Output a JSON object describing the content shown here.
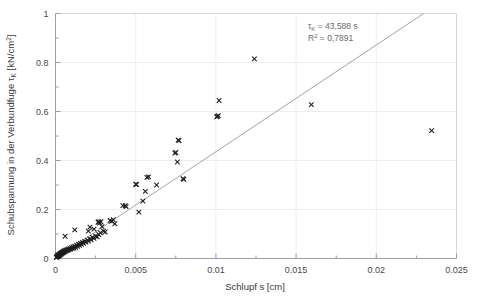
{
  "chart_data": {
    "type": "scatter",
    "title": "",
    "xlabel": "Schlupf  s  [cm]",
    "ylabel": "Schubspannung in der Verbundfuge τₖ  [kN/cm²]",
    "ylabel_parts": {
      "main": "Schubspannung in der Verbundfuge ",
      "symbol": "τ",
      "subscript": "K",
      "units": "  [kN/cm",
      "superscript": "2",
      "units_close": "]"
    },
    "xlabel_parts": {
      "name": "Schlupf",
      "symbol": "s",
      "units": "[cm]"
    },
    "xlim": [
      0,
      0.025
    ],
    "ylim": [
      0,
      1
    ],
    "xticks": [
      0,
      0.005,
      0.01,
      0.015,
      0.02,
      0.025
    ],
    "xtick_labels": [
      "0",
      "0.005",
      "0.01",
      "0.015",
      "0.02",
      "0.025"
    ],
    "yticks": [
      0,
      0.2,
      0.4,
      0.6,
      0.8,
      1
    ],
    "ytick_labels": [
      "0",
      "0.2",
      "0.4",
      "0.6",
      "0.8",
      "1"
    ],
    "xminor_count": 1,
    "yminor_count": 1,
    "grid": true,
    "grid_color": "#eceff1",
    "legend": false,
    "marker": "x",
    "marker_color": "#1d1d1d",
    "marker_size": 4.6,
    "series": [
      {
        "name": "Messwerte",
        "points": [
          [
            5e-05,
            0.004
          ],
          [
            8e-05,
            0.006
          ],
          [
            0.0001,
            0.008
          ],
          [
            0.00012,
            0.01
          ],
          [
            0.00014,
            0.012
          ],
          [
            0.00016,
            0.009
          ],
          [
            0.00018,
            0.014
          ],
          [
            0.0002,
            0.011
          ],
          [
            0.00022,
            0.016
          ],
          [
            0.00024,
            0.013
          ],
          [
            0.00026,
            0.018
          ],
          [
            0.00028,
            0.015
          ],
          [
            0.0003,
            0.02
          ],
          [
            0.00032,
            0.017
          ],
          [
            0.00034,
            0.022
          ],
          [
            0.00036,
            0.019
          ],
          [
            0.00038,
            0.024
          ],
          [
            0.0004,
            0.021
          ],
          [
            0.00042,
            0.026
          ],
          [
            0.00045,
            0.023
          ],
          [
            0.00048,
            0.028
          ],
          [
            0.0005,
            0.025
          ],
          [
            0.00052,
            0.03
          ],
          [
            0.00055,
            0.027
          ],
          [
            0.00058,
            0.032
          ],
          [
            0.0006,
            0.029
          ],
          [
            0.00064,
            0.034
          ],
          [
            0.00068,
            0.031
          ],
          [
            0.00072,
            0.036
          ],
          [
            0.00076,
            0.033
          ],
          [
            0.0008,
            0.038
          ],
          [
            0.00085,
            0.035
          ],
          [
            0.0009,
            0.041
          ],
          [
            0.00095,
            0.038
          ],
          [
            0.001,
            0.044
          ],
          [
            0.00105,
            0.04
          ],
          [
            0.0011,
            0.047
          ],
          [
            0.00115,
            0.043
          ],
          [
            0.0012,
            0.05
          ],
          [
            0.00126,
            0.046
          ],
          [
            0.00132,
            0.054
          ],
          [
            0.00138,
            0.05
          ],
          [
            0.00144,
            0.058
          ],
          [
            0.0015,
            0.054
          ],
          [
            0.00156,
            0.062
          ],
          [
            0.00162,
            0.058
          ],
          [
            0.00168,
            0.066
          ],
          [
            0.00175,
            0.062
          ],
          [
            0.00182,
            0.07
          ],
          [
            0.0019,
            0.067
          ],
          [
            0.00198,
            0.075
          ],
          [
            0.00206,
            0.071
          ],
          [
            0.00214,
            0.08
          ],
          [
            0.00222,
            0.076
          ],
          [
            0.0023,
            0.086
          ],
          [
            0.0024,
            0.082
          ],
          [
            0.0025,
            0.092
          ],
          [
            0.0026,
            0.088
          ],
          [
            0.0027,
            0.098
          ],
          [
            0.0028,
            0.105
          ],
          [
            0.0006,
            0.091
          ],
          [
            0.0012,
            0.117
          ],
          [
            0.00205,
            0.112
          ],
          [
            0.00215,
            0.128
          ],
          [
            0.0024,
            0.12
          ],
          [
            0.00265,
            0.148
          ],
          [
            0.0027,
            0.15
          ],
          [
            0.00275,
            0.145
          ],
          [
            0.00283,
            0.15
          ],
          [
            0.0029,
            0.13
          ],
          [
            0.003,
            0.112
          ],
          [
            0.0031,
            0.108
          ],
          [
            0.0034,
            0.155
          ],
          [
            0.0035,
            0.152
          ],
          [
            0.0036,
            0.158
          ],
          [
            0.0037,
            0.142
          ],
          [
            0.0042,
            0.216
          ],
          [
            0.00435,
            0.216
          ],
          [
            0.0044,
            0.212
          ],
          [
            0.005,
            0.303
          ],
          [
            0.00505,
            0.302
          ],
          [
            0.0052,
            0.189
          ],
          [
            0.00545,
            0.234
          ],
          [
            0.0056,
            0.274
          ],
          [
            0.0057,
            0.331
          ],
          [
            0.0058,
            0.333
          ],
          [
            0.0063,
            0.3
          ],
          [
            0.00745,
            0.43
          ],
          [
            0.0075,
            0.433
          ],
          [
            0.0076,
            0.394
          ],
          [
            0.00765,
            0.483
          ],
          [
            0.0077,
            0.481
          ],
          [
            0.00795,
            0.326
          ],
          [
            0.008,
            0.323
          ],
          [
            0.01005,
            0.578
          ],
          [
            0.0101,
            0.58
          ],
          [
            0.01015,
            0.583
          ],
          [
            0.0102,
            0.645
          ],
          [
            0.0124,
            0.815
          ],
          [
            0.01595,
            0.628
          ],
          [
            0.02345,
            0.522
          ]
        ]
      }
    ],
    "fit_line": {
      "type": "line",
      "x0": 0,
      "y0": 0,
      "x1": 0.02295,
      "y1": 1.0,
      "slope": 43.588,
      "color": "#9a9a9a"
    },
    "annotations": [
      {
        "id": "slope-annotation",
        "symbol": "τ",
        "subscript": "K",
        "equals": " = 43,588   s",
        "full_text": "τₖ = 43,588   s"
      },
      {
        "id": "r2-annotation",
        "symbol": "R",
        "superscript": "2",
        "equals": " = 0,7891",
        "full_text": "R² = 0,7891"
      }
    ]
  },
  "colors": {
    "background": "#ffffff",
    "marker": "#1d1d1d",
    "fit_line": "#9a9a9a",
    "grid": "#eceff1",
    "axis": "#9aa0a6",
    "text": "#3a3a3a",
    "annotation_text": "#6b6b6b"
  }
}
